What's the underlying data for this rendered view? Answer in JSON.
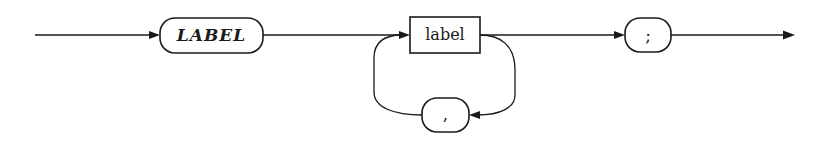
{
  "diagram": {
    "type": "syntax-diagram",
    "nodes": [
      {
        "id": "kw_label",
        "kind": "terminal",
        "shape": "rounded",
        "text": "LABEL",
        "style": "bold-italic"
      },
      {
        "id": "nt_label",
        "kind": "nonterminal",
        "shape": "rectangle",
        "text": "label"
      },
      {
        "id": "comma",
        "kind": "terminal",
        "shape": "rounded",
        "text": ","
      },
      {
        "id": "semicolon",
        "kind": "terminal",
        "shape": "rounded",
        "text": ";"
      }
    ],
    "edges": [
      {
        "from": "start",
        "to": "kw_label"
      },
      {
        "from": "kw_label",
        "to": "nt_label"
      },
      {
        "from": "nt_label",
        "to": "comma",
        "note": "repeat loop"
      },
      {
        "from": "comma",
        "to": "nt_label"
      },
      {
        "from": "nt_label",
        "to": "semicolon"
      },
      {
        "from": "semicolon",
        "to": "end"
      }
    ]
  },
  "labels": {
    "keyword": "LABEL",
    "nonterminal": "label",
    "separator": ",",
    "terminator": ";"
  }
}
